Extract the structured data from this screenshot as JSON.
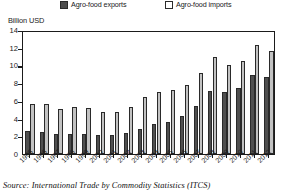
{
  "chart_data": {
    "type": "bar",
    "title": "",
    "xlabel": "",
    "ylabel": "Billion USD",
    "ylim": [
      0,
      14
    ],
    "yticks": [
      0,
      2,
      4,
      6,
      8,
      10,
      12,
      14
    ],
    "grid": false,
    "legend_position": "top",
    "categories": [
      "1995",
      "1996",
      "1997",
      "1998",
      "1999",
      "2000",
      "2001",
      "2002",
      "2003",
      "2004",
      "2005",
      "2006",
      "2007",
      "2008",
      "2009",
      "2010",
      "2011",
      "2012"
    ],
    "series": [
      {
        "name": "Agro-food exports",
        "color": "#4f4f4f",
        "values": [
          2.6,
          2.5,
          2.3,
          2.25,
          2.3,
          2.15,
          2.2,
          2.4,
          2.8,
          3.35,
          3.6,
          4.25,
          5.45,
          7.1,
          6.95,
          7.5,
          8.9,
          8.7
        ]
      },
      {
        "name": "Agro-food imports",
        "color": "#c2c2c2",
        "values": [
          5.6,
          5.6,
          5.1,
          5.3,
          5.2,
          4.8,
          4.8,
          5.3,
          6.4,
          6.95,
          7.2,
          7.75,
          9.1,
          10.9,
          10.1,
          10.55,
          12.35,
          11.6
        ]
      }
    ]
  },
  "legend": {
    "exports_label": "Agro-food exports",
    "imports_label": "Agro-food imports",
    "exports_swatch": "dark-square-icon",
    "imports_swatch": "light-square-icon"
  },
  "axis": {
    "unit_label": "Billion USD"
  },
  "source": {
    "text": "Source: International Trade by Commodity Statistics (ITCS)"
  }
}
